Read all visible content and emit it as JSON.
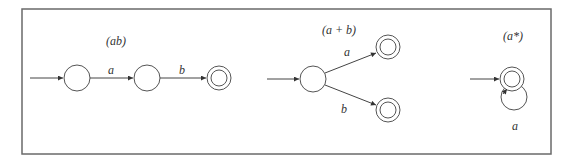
{
  "figure": {
    "diagrams": [
      {
        "title": "(ab)",
        "states": [
          "start",
          "middle",
          "accept"
        ],
        "transitions": [
          {
            "from": "start",
            "to": "middle",
            "label": "a"
          },
          {
            "from": "middle",
            "to": "accept",
            "label": "b"
          }
        ]
      },
      {
        "title": "(a + b)",
        "states": [
          "start",
          "accept_a",
          "accept_b"
        ],
        "transitions": [
          {
            "from": "start",
            "to": "accept_a",
            "label": "a"
          },
          {
            "from": "start",
            "to": "accept_b",
            "label": "b"
          }
        ]
      },
      {
        "title": "(a*)",
        "states": [
          "start_accept"
        ],
        "transitions": [
          {
            "from": "start_accept",
            "to": "start_accept",
            "label": "a"
          }
        ]
      }
    ]
  },
  "colors": {
    "frame": "#6a6a6a",
    "stroke": "#444444",
    "text": "#333333"
  }
}
